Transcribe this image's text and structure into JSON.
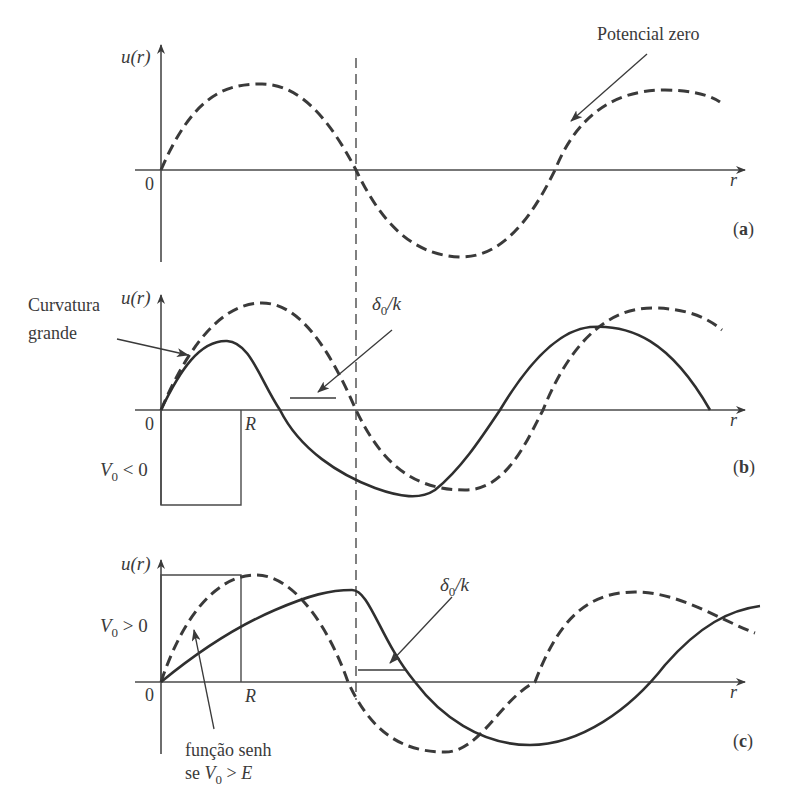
{
  "figure": {
    "vertical_reference_line": "dashed vertical line through first node of free solution"
  },
  "panels": [
    {
      "id": "a",
      "label": "(a)",
      "label_letter": "a",
      "y_axis_label": "u(r)",
      "x_axis_label": "r",
      "origin_label": "0",
      "annotations": [
        {
          "text": "Potencial zero",
          "points_to": "dashed curve (free wave)"
        }
      ],
      "curves": [
        {
          "style": "dashed",
          "meaning": "sin(kr), potential zero"
        }
      ]
    },
    {
      "id": "b",
      "label": "(b)",
      "label_letter": "b",
      "y_axis_label": "u(r)",
      "x_axis_label": "r",
      "origin_label": "0",
      "R_label": "R",
      "well_label": "V",
      "well_sub": "0",
      "well_rel": " < 0",
      "annotations": [
        {
          "text_line1": "Curvatura",
          "text_line2": "grande",
          "points_to": "solid curve inside well"
        },
        {
          "delta": "δ",
          "delta_sub": "0",
          "delta_rest": "/k",
          "points_to": "phase shift marker"
        }
      ],
      "curves": [
        {
          "style": "dashed",
          "meaning": "free wave"
        },
        {
          "style": "solid",
          "meaning": "wave with attractive potential (shifted inward)"
        }
      ]
    },
    {
      "id": "c",
      "label": "(c)",
      "label_letter": "c",
      "y_axis_label": "u(r)",
      "x_axis_label": "r",
      "origin_label": "0",
      "R_label": "R",
      "barrier_label": "V",
      "barrier_sub": "0",
      "barrier_rel": " > 0",
      "annotations": [
        {
          "text_line1": "função senh",
          "text_line2_pre": "se ",
          "text_line2_v": "V",
          "text_line2_sub": "0",
          "text_line2_post": " > ",
          "text_line2_e": "E",
          "points_to": "solid curve inside barrier"
        },
        {
          "delta": "δ",
          "delta_sub": "0",
          "delta_rest": "/k",
          "points_to": "phase shift marker"
        }
      ],
      "curves": [
        {
          "style": "dashed",
          "meaning": "free wave"
        },
        {
          "style": "solid",
          "meaning": "wave with repulsive potential (shifted outward)"
        }
      ]
    }
  ],
  "colors": {
    "ink": "#3a3a3a",
    "background": "#ffffff"
  }
}
